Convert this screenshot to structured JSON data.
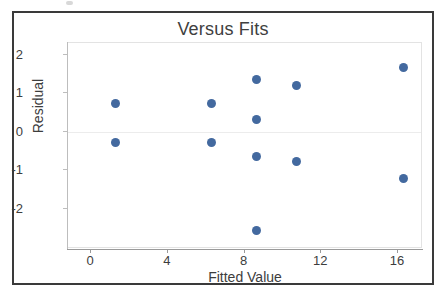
{
  "chart_data": {
    "type": "scatter",
    "title": "Versus Fits",
    "xlabel": "Fitted Value",
    "ylabel": "Residual",
    "xlim": [
      -1.2,
      17.2
    ],
    "ylim": [
      -3.0,
      2.3
    ],
    "xticks": [
      0,
      4,
      8,
      12,
      16
    ],
    "xtick_labels": [
      "0",
      "4",
      "8",
      "12",
      "16"
    ],
    "yticks": [
      2,
      1,
      0,
      -1,
      -2
    ],
    "ytick_labels": [
      "2",
      "1",
      "0",
      "-1",
      "-2"
    ],
    "grid": "zero-line-only",
    "legend": "none",
    "marker_color": "#43699f",
    "marker_size": 9,
    "points": [
      {
        "x": 1.3,
        "y": 0.72
      },
      {
        "x": 1.3,
        "y": -0.29
      },
      {
        "x": 6.3,
        "y": 0.72
      },
      {
        "x": 6.3,
        "y": -0.29
      },
      {
        "x": 8.65,
        "y": 1.36
      },
      {
        "x": 8.65,
        "y": 0.32
      },
      {
        "x": 8.65,
        "y": -0.66
      },
      {
        "x": 8.65,
        "y": -2.57
      },
      {
        "x": 10.7,
        "y": 1.19
      },
      {
        "x": 10.7,
        "y": -0.78
      },
      {
        "x": 16.3,
        "y": 1.66
      },
      {
        "x": 16.3,
        "y": -1.22
      }
    ]
  },
  "colors": {
    "marker": "#43699f",
    "frame": "#3a3a3a",
    "panel_border": "#e3e3e3",
    "axis": "#9a9a9a",
    "text": "#3d3d3d",
    "title_text": "#404040"
  }
}
